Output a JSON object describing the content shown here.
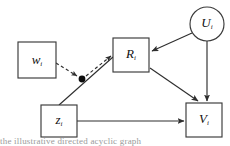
{
  "figure": {
    "type": "causal-dag",
    "background": "#ffffff",
    "node_stroke": "#3a3a3a",
    "edge_stroke": "#2e2e2e",
    "label_color": "#111111",
    "junction_color": "#0d0d0d"
  },
  "nodes": [
    {
      "id": "w",
      "shape": "rect",
      "role": "observed",
      "base": "w",
      "subscript": "i",
      "x": 18,
      "y": 42,
      "width": 38,
      "height": 36
    },
    {
      "id": "R",
      "shape": "rect",
      "role": "observed",
      "base": "R",
      "subscript": "i",
      "x": 113,
      "y": 38,
      "width": 36,
      "height": 34
    },
    {
      "id": "z",
      "shape": "rect",
      "role": "observed",
      "base": "z",
      "subscript": "i",
      "x": 41,
      "y": 105,
      "width": 36,
      "height": 32
    },
    {
      "id": "V",
      "shape": "rect",
      "role": "observed",
      "base": "V",
      "subscript": "i",
      "x": 186,
      "y": 103,
      "width": 36,
      "height": 34
    },
    {
      "id": "U",
      "shape": "circle",
      "role": "latent",
      "base": "U",
      "subscript": "i",
      "cx": 207,
      "cy": 24,
      "r": 17
    }
  ],
  "junctions": [
    {
      "id": "mediator-dot",
      "cx": 82,
      "cy": 79,
      "r": 3.4
    }
  ],
  "edges": [
    {
      "id": "w-to-dot",
      "from": "w",
      "to": "mediator-dot",
      "style": "dashed",
      "arrow": "true"
    },
    {
      "id": "dot-to-R",
      "from": "mediator-dot",
      "to": "R",
      "style": "dashed",
      "arrow": "true"
    },
    {
      "id": "z-to-R",
      "from": "z",
      "to": "R",
      "style": "solid",
      "arrow": "false"
    },
    {
      "id": "U-to-R",
      "from": "U",
      "to": "R",
      "style": "solid",
      "arrow": "true"
    },
    {
      "id": "U-to-V",
      "from": "U",
      "to": "V",
      "style": "solid",
      "arrow": "true"
    },
    {
      "id": "R-to-V",
      "from": "R",
      "to": "V",
      "style": "solid",
      "arrow": "true"
    },
    {
      "id": "z-to-V",
      "from": "z",
      "to": "V",
      "style": "solid",
      "arrow": "true"
    }
  ],
  "caption": {
    "clipped_text": "the illustrative directed acyclic graph"
  }
}
